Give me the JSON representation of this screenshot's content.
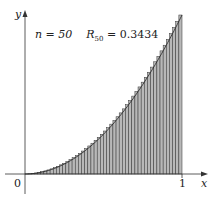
{
  "chart_data": {
    "type": "bar",
    "title": "",
    "function": "y = x^2",
    "method": "right endpoint Riemann sum",
    "n": 50,
    "annotation": {
      "n_label": "n = 50",
      "sum_symbol": "R",
      "sum_sub": "50",
      "sum_value": "= 0.3434"
    },
    "xlabel": "x",
    "ylabel": "y",
    "x_ticks": [
      "0",
      "1"
    ],
    "xlim": [
      0,
      1
    ],
    "ylim": [
      0,
      1
    ],
    "grid": false,
    "legend": "none",
    "bar_fill": "#b8b8b8",
    "bar_stroke": "#333333"
  }
}
